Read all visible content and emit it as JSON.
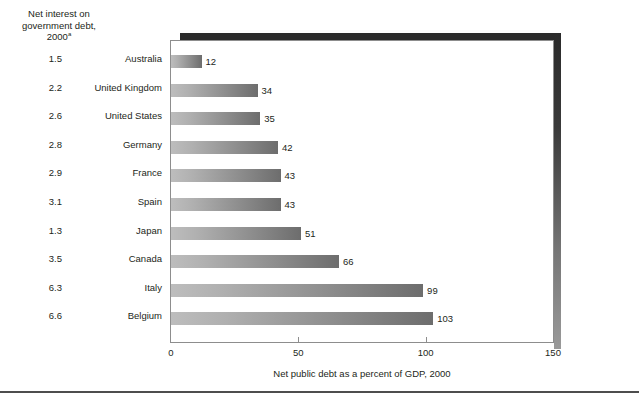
{
  "left_header": {
    "line1": "Net interest on",
    "line2": "government debt,",
    "line3": "2000",
    "footnote_marker": "a"
  },
  "columns": {
    "interest_header": "Net interest on government debt, 2000a",
    "country_header": ""
  },
  "xaxis_title": "Net public debt as a percent of GDP, 2000",
  "xticks": [
    "0",
    "50",
    "100",
    "150"
  ],
  "rows": [
    {
      "interest": "1.5",
      "country": "Australia",
      "debt_label": "12"
    },
    {
      "interest": "2.2",
      "country": "United Kingdom",
      "debt_label": "34"
    },
    {
      "interest": "2.6",
      "country": "United States",
      "debt_label": "35"
    },
    {
      "interest": "2.8",
      "country": "Germany",
      "debt_label": "42"
    },
    {
      "interest": "2.9",
      "country": "France",
      "debt_label": "43"
    },
    {
      "interest": "3.1",
      "country": "Spain",
      "debt_label": "43"
    },
    {
      "interest": "1.3",
      "country": "Japan",
      "debt_label": "51"
    },
    {
      "interest": "3.5",
      "country": "Canada",
      "debt_label": "66"
    },
    {
      "interest": "6.3",
      "country": "Italy",
      "debt_label": "99"
    },
    {
      "interest": "6.6",
      "country": "Belgium",
      "debt_label": "103"
    }
  ],
  "chart_data": {
    "type": "bar",
    "orientation": "horizontal",
    "title": "",
    "xlabel": "Net public debt as a percent of GDP, 2000",
    "ylabel": "",
    "xlim": [
      0,
      150
    ],
    "xticks": [
      0,
      50,
      100,
      150
    ],
    "grid": false,
    "legend": false,
    "categories": [
      "Australia",
      "United Kingdom",
      "United States",
      "Germany",
      "France",
      "Spain",
      "Japan",
      "Canada",
      "Italy",
      "Belgium"
    ],
    "values": [
      12,
      34,
      35,
      42,
      43,
      43,
      51,
      66,
      99,
      103
    ],
    "data_labels": [
      "12",
      "34",
      "35",
      "42",
      "43",
      "43",
      "51",
      "66",
      "99",
      "103"
    ],
    "side_table": {
      "header": "Net interest on government debt, 2000a",
      "values": [
        1.5,
        2.2,
        2.6,
        2.8,
        2.9,
        3.1,
        1.3,
        3.5,
        6.3,
        6.6
      ]
    },
    "bar_fill": "#9a9a9a",
    "bar_gradient": [
      "#bdbdbd",
      "#6d6d6d"
    ]
  }
}
